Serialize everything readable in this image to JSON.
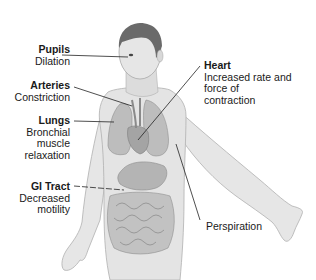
{
  "diagram": {
    "type": "anatomical-illustration",
    "colors": {
      "background": "#ffffff",
      "skin": "#e4e4e4",
      "skin_shadow": "#c9c9c9",
      "hair": "#6a6a6a",
      "organs": "#b8b8b8",
      "organ_dark": "#9a9a9a",
      "leader_line": "#222222",
      "text": "#1a1a1a"
    }
  },
  "labels": [
    {
      "id": "pupils",
      "title": "Pupils",
      "description": "Dilation"
    },
    {
      "id": "arteries",
      "title": "Arteries",
      "description": "Constriction"
    },
    {
      "id": "lungs",
      "title": "Lungs",
      "description_lines": [
        "Bronchial",
        "muscle",
        "relaxation"
      ]
    },
    {
      "id": "gi-tract",
      "title": "GI Tract",
      "description_lines": [
        "Decreased",
        "motility"
      ]
    },
    {
      "id": "heart",
      "title": "Heart",
      "description_lines": [
        "Increased rate and",
        "force of",
        "contraction"
      ]
    },
    {
      "id": "perspiration",
      "title": "",
      "description": "Perspiration"
    }
  ]
}
